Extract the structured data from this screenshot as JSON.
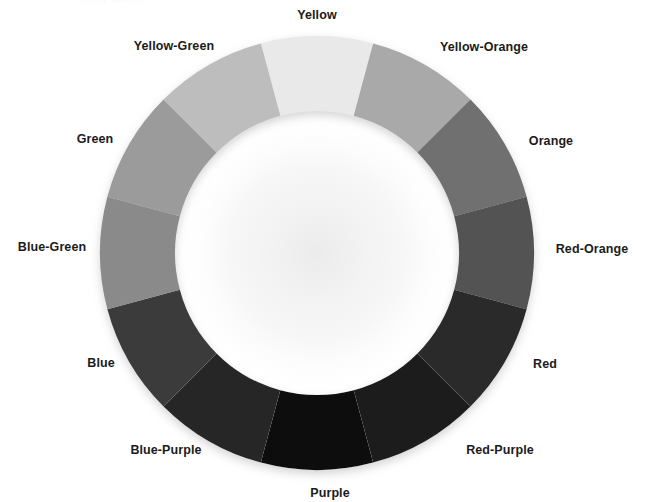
{
  "page": {
    "width": 646,
    "height": 502,
    "background": "#ffffff",
    "clipped_title": "Color Wheel"
  },
  "wheel": {
    "center_x": 317,
    "center_y": 253,
    "outer_radius": 217,
    "inner_radius": 142,
    "segment_count": 12,
    "segment_degrees": 30,
    "start_angle_deg": -15,
    "label_radius": 248,
    "shadow_color": "#d8d8d8"
  },
  "chart_data": {
    "type": "pie",
    "title": "Color Wheel",
    "subtype": "donut",
    "xlabel": "",
    "ylabel": "",
    "legend_position": "radial-outside",
    "grid": false,
    "categories": [
      "Yellow",
      "Yellow-Orange",
      "Orange",
      "Red-Orange",
      "Red",
      "Red-Purple",
      "Purple",
      "Blue-Purple",
      "Blue",
      "Blue-Green",
      "Green",
      "Yellow-Green"
    ],
    "values": [
      30,
      30,
      30,
      30,
      30,
      30,
      30,
      30,
      30,
      30,
      30,
      30
    ],
    "colors": [
      "#e9e9e9",
      "#a9a9a9",
      "#6f6f6f",
      "#525252",
      "#2c2c2c",
      "#1f1f1f",
      "#0a0a0a",
      "#282828",
      "#3b3b3b",
      "#8a8a8a",
      "#9b9b9b",
      "#bdbdbd"
    ],
    "segments": [
      {
        "label": "Yellow",
        "color": "#e9e9e9",
        "start_deg": -15,
        "end_deg": 15,
        "label_angle_deg": 0,
        "label_x": 317,
        "label_y": 15
      },
      {
        "label": "Yellow-Orange",
        "color": "#a9a9a9",
        "start_deg": 15,
        "end_deg": 45,
        "label_angle_deg": 30,
        "label_x": 484,
        "label_y": 47
      },
      {
        "label": "Orange",
        "color": "#6f6f6f",
        "start_deg": 45,
        "end_deg": 75,
        "label_angle_deg": 60,
        "label_x": 551,
        "label_y": 141
      },
      {
        "label": "Red-Orange",
        "color": "#525252",
        "start_deg": 75,
        "end_deg": 105,
        "label_angle_deg": 90,
        "label_x": 592,
        "label_y": 249
      },
      {
        "label": "Red",
        "color": "#2c2c2c",
        "start_deg": 105,
        "end_deg": 135,
        "label_angle_deg": 120,
        "label_x": 545,
        "label_y": 364
      },
      {
        "label": "Red-Purple",
        "color": "#1f1f1f",
        "start_deg": 135,
        "end_deg": 165,
        "label_angle_deg": 150,
        "label_x": 500,
        "label_y": 450
      },
      {
        "label": "Purple",
        "color": "#0a0a0a",
        "start_deg": 165,
        "end_deg": 195,
        "label_angle_deg": 180,
        "label_x": 330,
        "label_y": 493
      },
      {
        "label": "Blue-Purple",
        "color": "#282828",
        "start_deg": 195,
        "end_deg": 225,
        "label_angle_deg": 210,
        "label_x": 166,
        "label_y": 450
      },
      {
        "label": "Blue",
        "color": "#3b3b3b",
        "start_deg": 225,
        "end_deg": 255,
        "label_angle_deg": 240,
        "label_x": 101,
        "label_y": 363
      },
      {
        "label": "Blue-Green",
        "color": "#8a8a8a",
        "start_deg": 255,
        "end_deg": 285,
        "label_angle_deg": 270,
        "label_x": 52,
        "label_y": 247
      },
      {
        "label": "Green",
        "color": "#9b9b9b",
        "start_deg": 285,
        "end_deg": 315,
        "label_angle_deg": 300,
        "label_x": 95,
        "label_y": 139
      },
      {
        "label": "Yellow-Green",
        "color": "#bdbdbd",
        "start_deg": 315,
        "end_deg": 345,
        "label_angle_deg": 330,
        "label_x": 174,
        "label_y": 46
      }
    ]
  }
}
